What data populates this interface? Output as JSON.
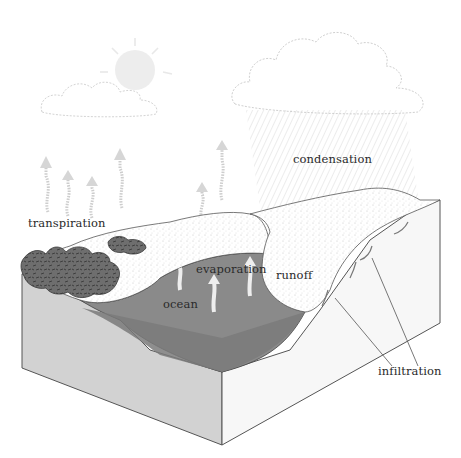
{
  "diagram": {
    "type": "water-cycle",
    "labels": {
      "condensation": "condensation",
      "transpiration": "transpiration",
      "evaporation": "evaporation",
      "runoff": "runoff",
      "ocean": "ocean",
      "infiltration": "infiltration"
    },
    "elements": {
      "sun": "sun-icon",
      "small_cloud": "cloud-icon",
      "rain_cloud": "rain-cloud-icon",
      "vapor_arrows": "up-arrow-icon",
      "trees": "forest-icon",
      "flow_arrows": "curved-arrow-icon"
    },
    "colors": {
      "background": "#ffffff",
      "ocean_surface": "#8a8a8a",
      "ocean_depth": "#7a7a7a",
      "block_left_face": "#d2d2d2",
      "block_right_face": "#f7f7f7",
      "trees": "#6a6a6a",
      "cloud_outline": "#cfcfcf",
      "sun": "#ececec",
      "text": "#2a2a2a",
      "lines": "#555555"
    }
  }
}
